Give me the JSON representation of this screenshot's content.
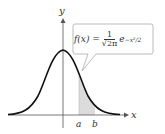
{
  "diagram": {
    "axes": {
      "x_label": "x",
      "y_label": "y"
    },
    "formula": {
      "lhs": "f(x) =",
      "numerator": "1",
      "denominator": "√2π",
      "base": "e",
      "exponent": "−x²/2"
    },
    "ticks": [
      {
        "label": "a"
      },
      {
        "label": "b"
      }
    ],
    "colors": {
      "curve": "#111111",
      "axis": "#555555",
      "shade": "#d8d8d8",
      "callout_border": "#aaaaaa"
    }
  }
}
